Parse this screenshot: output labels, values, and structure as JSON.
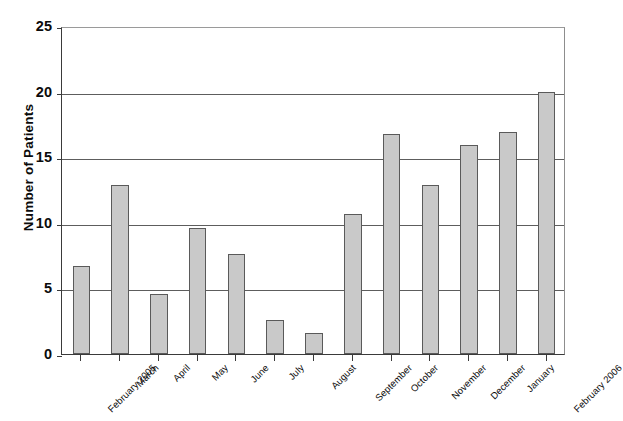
{
  "chart_data": {
    "type": "bar",
    "title": "",
    "xlabel": "",
    "ylabel": "Number of Patients",
    "ylim": [
      0,
      25
    ],
    "yticks": [
      0,
      5,
      10,
      15,
      20,
      25
    ],
    "ytick_labels": [
      "0",
      "5",
      "10",
      "15",
      "20",
      "25"
    ],
    "grid": true,
    "legend": "none",
    "bar_color": "#c9c9c9",
    "bar_edge_color": "#5a5a5a",
    "grid_color": "#5d5d5d",
    "axis_color": "#3a3a3a",
    "categories": [
      "February 2005",
      "March",
      "April",
      "May",
      "June",
      "July",
      "August",
      "September",
      "October",
      "November",
      "December",
      "January",
      "February 2006"
    ],
    "values": [
      6.7,
      12.9,
      4.6,
      9.6,
      7.6,
      2.6,
      1.6,
      10.7,
      16.8,
      12.9,
      15.9,
      16.9,
      20.0
    ]
  }
}
